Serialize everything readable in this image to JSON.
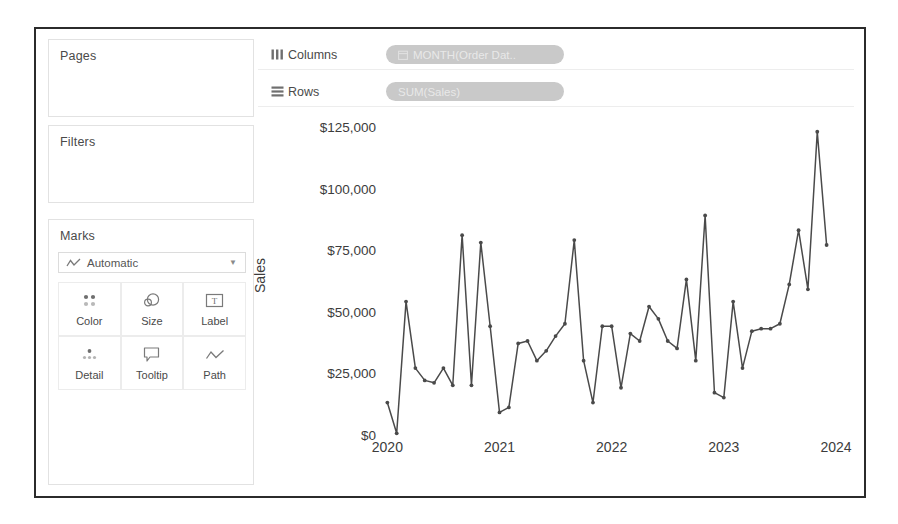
{
  "shelves": {
    "columns": {
      "label": "Columns",
      "icon": "columns-icon",
      "pill": "MONTH(Order Dat..",
      "pill_icon": "calendar-icon",
      "pill_color": "#c9c9c9"
    },
    "rows": {
      "label": "Rows",
      "icon": "rows-icon",
      "pill": "SUM(Sales)",
      "pill_color": "#c9c9c9"
    }
  },
  "cards": {
    "pages": {
      "title": "Pages"
    },
    "filters": {
      "title": "Filters"
    },
    "marks": {
      "title": "Marks",
      "type_selector": {
        "value": "Automatic",
        "icon": "line-chart-icon",
        "caret": "chevron-down-icon"
      },
      "buttons": [
        {
          "label": "Color",
          "icon": "color-dots-icon"
        },
        {
          "label": "Size",
          "icon": "size-circles-icon"
        },
        {
          "label": "Label",
          "icon": "label-text-icon"
        },
        {
          "label": "Detail",
          "icon": "detail-dots-icon"
        },
        {
          "label": "Tooltip",
          "icon": "tooltip-bubble-icon"
        },
        {
          "label": "Path",
          "icon": "path-line-icon"
        }
      ]
    }
  },
  "chart_data": {
    "type": "line",
    "title": "",
    "xlabel": "",
    "ylabel": "Sales",
    "ylim": [
      0,
      130000
    ],
    "yticks": [
      0,
      25000,
      50000,
      75000,
      100000,
      125000
    ],
    "ytick_labels": [
      "$0",
      "$25,000",
      "$50,000",
      "$75,000",
      "$100,000",
      "$125,000"
    ],
    "xtick_labels": [
      "2020",
      "2021",
      "2022",
      "2023",
      "2024"
    ],
    "xtick_values": [
      "2020-01",
      "2021-01",
      "2022-01",
      "2023-01",
      "2024-01"
    ],
    "grid": false,
    "legend": false,
    "line_color": "#4a4a4a",
    "marker": "circle",
    "x": [
      "2020-01",
      "2020-02",
      "2020-03",
      "2020-04",
      "2020-05",
      "2020-06",
      "2020-07",
      "2020-08",
      "2020-09",
      "2020-10",
      "2020-11",
      "2020-12",
      "2021-01",
      "2021-02",
      "2021-03",
      "2021-04",
      "2021-05",
      "2021-06",
      "2021-07",
      "2021-08",
      "2021-09",
      "2021-10",
      "2021-11",
      "2021-12",
      "2022-01",
      "2022-02",
      "2022-03",
      "2022-04",
      "2022-05",
      "2022-06",
      "2022-07",
      "2022-08",
      "2022-09",
      "2022-10",
      "2022-11",
      "2022-12",
      "2023-01",
      "2023-02",
      "2023-03",
      "2023-04",
      "2023-05",
      "2023-06",
      "2023-07",
      "2023-08",
      "2023-09",
      "2023-10",
      "2023-11",
      "2023-12"
    ],
    "values": [
      14000,
      1500,
      55000,
      28000,
      23000,
      22000,
      28000,
      21000,
      82000,
      21000,
      79000,
      45000,
      10000,
      12000,
      38000,
      39000,
      31000,
      35000,
      41000,
      46000,
      80000,
      31000,
      14000,
      45000,
      45000,
      20000,
      42000,
      39000,
      53000,
      48000,
      39000,
      36000,
      64000,
      31000,
      90000,
      18000,
      16000,
      55000,
      28000,
      43000,
      44000,
      44000,
      46000,
      62000,
      84000,
      60000,
      124000,
      78000
    ]
  }
}
